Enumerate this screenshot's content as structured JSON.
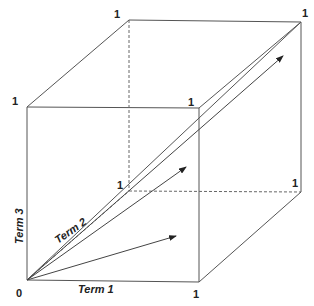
{
  "diagram": {
    "axes": {
      "x_label": "Term 1",
      "y_label": "Term 3",
      "z_label": "Term 2"
    },
    "origin_label": "0",
    "vertex_labels": {
      "front_top_left": "1",
      "back_top_left": "1",
      "back_top_right": "1",
      "front_top_right": "1",
      "back_bottom_left": "1",
      "back_bottom_right": "1",
      "front_bottom_right": "1"
    },
    "vectors": [
      {
        "name": "vector-a",
        "from": [
          27,
          280
        ],
        "to": [
          176,
          236
        ]
      },
      {
        "name": "vector-b",
        "from": [
          27,
          280
        ],
        "to": [
          186,
          167
        ]
      },
      {
        "name": "vector-c",
        "from": [
          27,
          280
        ],
        "to": [
          283,
          56
        ]
      }
    ],
    "colors": {
      "line": "#555555",
      "text": "#222222",
      "background": "#ffffff"
    }
  }
}
